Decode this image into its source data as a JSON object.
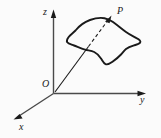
{
  "figure": {
    "type": "3d-coordinate-surface-diagram",
    "background_color": "#fbfbfb",
    "stroke_color": "#1a1a1a",
    "axis_color": "#4a4a4a",
    "axes": {
      "z": {
        "label": "z",
        "direction": "up",
        "arrow": true
      },
      "y": {
        "label": "y",
        "direction": "right",
        "arrow": true
      },
      "x": {
        "label": "x",
        "direction": "down-left",
        "arrow": true
      }
    },
    "origin": {
      "label": "O"
    },
    "point": {
      "label": "P"
    },
    "surface": {
      "name": "curved-surface-patch",
      "filled": false
    },
    "ray": {
      "name": "origin-to-point-arrow",
      "dashed_segment": true,
      "arrow": true
    }
  }
}
